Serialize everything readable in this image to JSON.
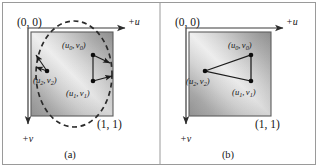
{
  "figure": {
    "background_color": "#ffffff",
    "border_color": "#9a9a9a",
    "ink_color": "#161616"
  },
  "panels": [
    {
      "id": "a",
      "caption": "(a)",
      "origin_label": "(0, 0)",
      "opposite_corner_label": "(1, 1)",
      "axis_u_label": "+u",
      "axis_v_label": "+v",
      "has_dashed_ellipse": true,
      "has_triangle": false,
      "shape_description": "dashed ellipse overlaying gradient unit square with three points and outward arrows",
      "points": [
        {
          "name": "p0",
          "label_u": "u",
          "label_u_sub": "0",
          "label_v": "v",
          "label_v_sub": "0"
        },
        {
          "name": "p1",
          "label_u": "u",
          "label_u_sub": "1",
          "label_v": "v",
          "label_v_sub": "1"
        },
        {
          "name": "p2",
          "label_u": "u",
          "label_u_sub": "2",
          "label_v": "v",
          "label_v_sub": "2"
        }
      ]
    },
    {
      "id": "b",
      "caption": "(b)",
      "origin_label": "(0, 0)",
      "opposite_corner_label": "(1, 1)",
      "axis_u_label": "+u",
      "axis_v_label": "+v",
      "has_dashed_ellipse": false,
      "has_triangle": true,
      "shape_description": "triangle connecting the three points inside gradient unit square",
      "points": [
        {
          "name": "p0",
          "label_u": "u",
          "label_u_sub": "0",
          "label_v": "v",
          "label_v_sub": "0"
        },
        {
          "name": "p1",
          "label_u": "u",
          "label_u_sub": "1",
          "label_v": "v",
          "label_v_sub": "1"
        },
        {
          "name": "p2",
          "label_u": "u",
          "label_u_sub": "2",
          "label_v": "v",
          "label_v_sub": "2"
        }
      ]
    }
  ],
  "punctuation": {
    "open_paren": "(",
    "close_paren": ")",
    "comma": ","
  }
}
